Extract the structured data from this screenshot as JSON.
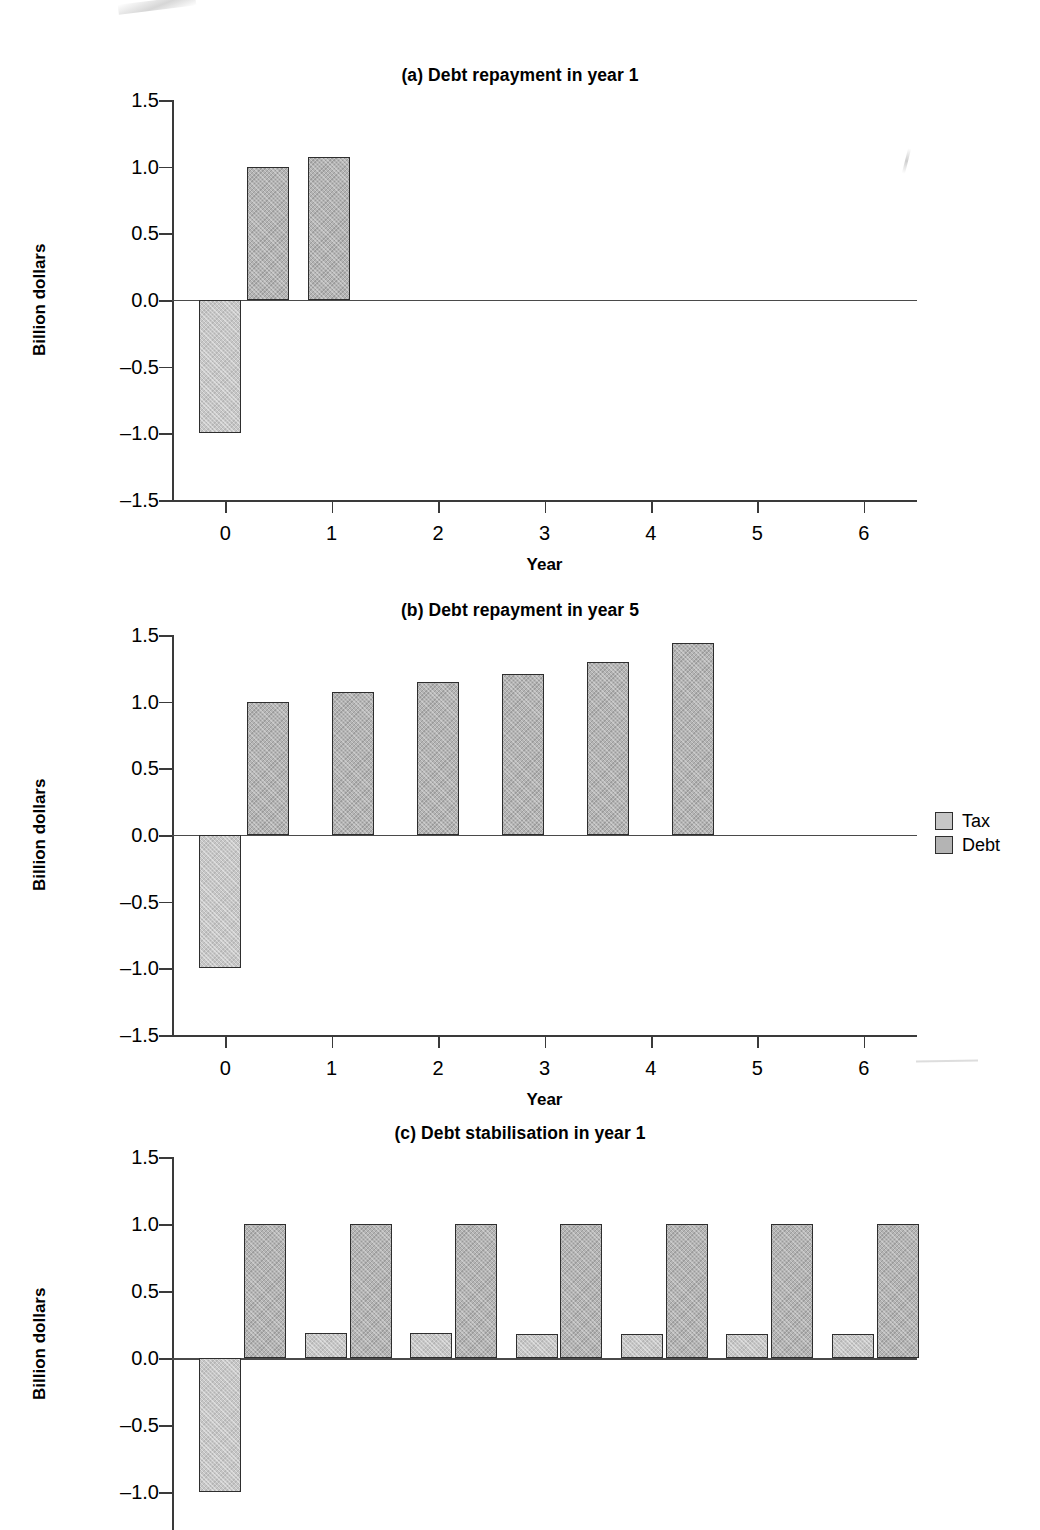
{
  "figure": {
    "ylabel": "Billion dollars",
    "xlabel": "Year",
    "ytick_labels": [
      "1.5",
      "1.0",
      "0.5",
      "0.0",
      "–0.5",
      "–1.0",
      "–1.5"
    ],
    "xtick_labels": [
      "0",
      "1",
      "2",
      "3",
      "4",
      "5",
      "6"
    ]
  },
  "legend": {
    "position": "right of panel (b)",
    "items": [
      {
        "label": "Tax",
        "color": "#c6c6c6"
      },
      {
        "label": "Debt",
        "color": "#b4b4b4"
      }
    ]
  },
  "chart_data": [
    {
      "type": "bar",
      "title": "(a) Debt repayment in year 1",
      "xlabel": "Year",
      "ylabel": "Billion dollars",
      "ylim": [
        -1.5,
        1.5
      ],
      "xlim": [
        -0.5,
        6.5
      ],
      "yticks": [
        1.5,
        1.0,
        0.5,
        0.0,
        -0.5,
        -1.0,
        -1.5
      ],
      "xticks": [
        0,
        1,
        2,
        3,
        4,
        5,
        6
      ],
      "grid": false,
      "legend": [
        "Tax",
        "Debt"
      ],
      "bars": [
        {
          "series": "Tax",
          "x": -0.25,
          "value": -1.0
        },
        {
          "series": "Debt",
          "x": 0.2,
          "value": 1.0
        },
        {
          "series": "Debt",
          "x": 0.78,
          "value": 1.07
        }
      ]
    },
    {
      "type": "bar",
      "title": "(b) Debt repayment in year 5",
      "xlabel": "Year",
      "ylabel": "Billion dollars",
      "ylim": [
        -1.5,
        1.5
      ],
      "xlim": [
        -0.5,
        6.5
      ],
      "yticks": [
        1.5,
        1.0,
        0.5,
        0.0,
        -0.5,
        -1.0,
        -1.5
      ],
      "xticks": [
        0,
        1,
        2,
        3,
        4,
        5,
        6
      ],
      "grid": false,
      "legend": [
        "Tax",
        "Debt"
      ],
      "bars": [
        {
          "series": "Tax",
          "x": -0.25,
          "value": -1.0
        },
        {
          "series": "Debt",
          "x": 0.2,
          "value": 1.0
        },
        {
          "series": "Debt",
          "x": 1.0,
          "value": 1.07
        },
        {
          "series": "Debt",
          "x": 1.8,
          "value": 1.15
        },
        {
          "series": "Debt",
          "x": 2.6,
          "value": 1.21
        },
        {
          "series": "Debt",
          "x": 3.4,
          "value": 1.3
        },
        {
          "series": "Debt",
          "x": 4.2,
          "value": 1.44
        }
      ]
    },
    {
      "type": "bar",
      "title": "(c) Debt stabilisation in year 1",
      "xlabel": "Year",
      "ylabel": "Billion dollars",
      "ylim": [
        -1.5,
        1.5
      ],
      "xlim": [
        -0.5,
        6.5
      ],
      "yticks": [
        1.5,
        1.0,
        0.5,
        0.0,
        -0.5,
        -1.0
      ],
      "xticks": [],
      "grid": false,
      "cropped_bottom": true,
      "legend": [
        "Tax",
        "Debt"
      ],
      "bars": [
        {
          "series": "Tax",
          "x": -0.25,
          "value": -1.0
        },
        {
          "series": "Debt",
          "x": 0.18,
          "value": 1.0
        },
        {
          "series": "Tax",
          "x": 0.75,
          "value": 0.19
        },
        {
          "series": "Debt",
          "x": 1.17,
          "value": 1.0
        },
        {
          "series": "Tax",
          "x": 1.74,
          "value": 0.19
        },
        {
          "series": "Debt",
          "x": 2.16,
          "value": 1.0
        },
        {
          "series": "Tax",
          "x": 2.73,
          "value": 0.18
        },
        {
          "series": "Debt",
          "x": 3.15,
          "value": 1.0
        },
        {
          "series": "Tax",
          "x": 3.72,
          "value": 0.18
        },
        {
          "series": "Debt",
          "x": 4.14,
          "value": 1.0
        },
        {
          "series": "Tax",
          "x": 4.71,
          "value": 0.18
        },
        {
          "series": "Debt",
          "x": 5.13,
          "value": 1.0
        },
        {
          "series": "Tax",
          "x": 5.7,
          "value": 0.18
        },
        {
          "series": "Debt",
          "x": 6.12,
          "value": 1.0
        }
      ]
    }
  ]
}
